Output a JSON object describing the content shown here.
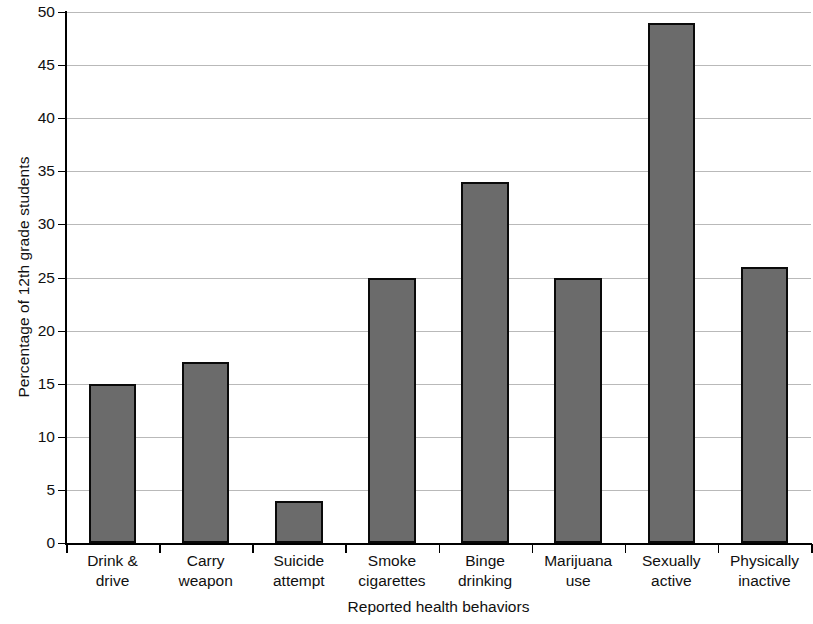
{
  "chart_data": {
    "type": "bar",
    "title": "",
    "xlabel": "Reported health behaviors",
    "ylabel": "Percentage of 12th grade students",
    "categories": [
      "Drink & drive",
      "Carry weapon",
      "Suicide attempt",
      "Smoke cigarettes",
      "Binge drinking",
      "Marijuana use",
      "Sexually active",
      "Physically inactive"
    ],
    "category_lines": [
      [
        "Drink &",
        "drive"
      ],
      [
        "Carry",
        "weapon"
      ],
      [
        "Suicide",
        "attempt"
      ],
      [
        "Smoke",
        "cigarettes"
      ],
      [
        "Binge",
        "drinking"
      ],
      [
        "Marijuana",
        "use"
      ],
      [
        "Sexually",
        "active"
      ],
      [
        "Physically",
        "inactive"
      ]
    ],
    "values": [
      15,
      17,
      4,
      25,
      34,
      25,
      49,
      26
    ],
    "ylim": [
      0,
      50
    ],
    "ytick_values": [
      0,
      5,
      10,
      15,
      20,
      25,
      30,
      35,
      40,
      45,
      50
    ],
    "ytick_labels": [
      "0",
      "5",
      "10",
      "15",
      "20",
      "25",
      "30",
      "35",
      "40",
      "45",
      "50"
    ],
    "grid": true,
    "legend": "none",
    "bar_color": "#6b6b6b",
    "bar_edge_color": "#0a0a0a",
    "grid_color": "#b9b9b9",
    "axis_color": "#000000"
  }
}
